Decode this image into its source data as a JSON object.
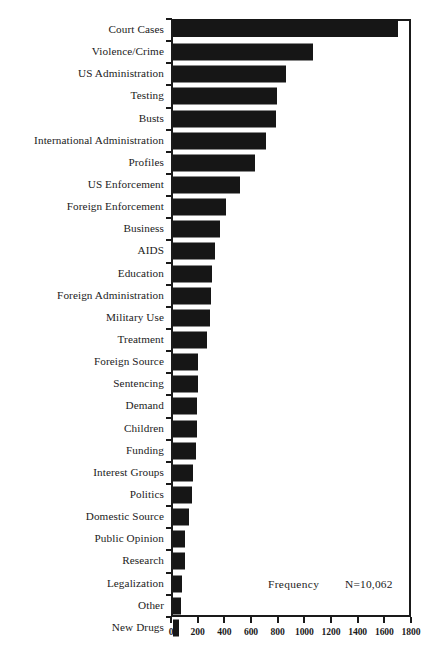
{
  "chart_data": {
    "type": "bar",
    "orientation": "horizontal",
    "title": "",
    "subtitle": "",
    "xlabel": "Frequency",
    "ylabel": "",
    "xlim": [
      0,
      1800
    ],
    "ylim": null,
    "grid": false,
    "legend": null,
    "bar_color": "#161616",
    "annotations": [
      {
        "name": "axis-caption",
        "text": "Frequency"
      },
      {
        "name": "sample-size",
        "text": "N=10,062"
      }
    ],
    "xticks": [
      0,
      200,
      400,
      600,
      800,
      1000,
      1200,
      1400,
      1600,
      1800
    ],
    "xticklabels": [
      "0",
      "200",
      "400",
      "600",
      "800",
      "1000",
      "1200",
      "1400",
      "1600",
      "1800"
    ],
    "categories": [
      "Court Cases",
      "Violence/Crime",
      "US Administration",
      "Testing",
      "Busts",
      "International Administration",
      "Profiles",
      "US Enforcement",
      "Foreign Enforcement",
      "Business",
      "AIDS",
      "Education",
      "Foreign Administration",
      "Military Use",
      "Treatment",
      "Foreign Source",
      "Sentencing",
      "Demand",
      "Children",
      "Funding",
      "Interest Groups",
      "Politics",
      "Domestic Source",
      "Public Opinion",
      "Research",
      "Legalization",
      "Other",
      "New Drugs"
    ],
    "values": [
      1700,
      1058,
      855,
      788,
      780,
      705,
      622,
      503,
      398,
      353,
      315,
      293,
      285,
      278,
      255,
      188,
      188,
      180,
      180,
      173,
      150,
      143,
      120,
      90,
      90,
      68,
      60,
      45
    ]
  }
}
